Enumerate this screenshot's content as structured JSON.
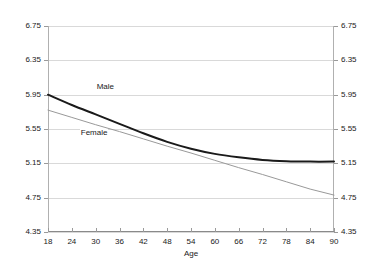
{
  "chart_data": {
    "type": "line",
    "title": "",
    "xlabel": "Age",
    "ylabel": "Mean Health Satisfaction",
    "xlim": [
      18,
      90
    ],
    "ylim": [
      4.35,
      6.75
    ],
    "xticks": [
      18,
      24,
      30,
      36,
      42,
      48,
      54,
      60,
      66,
      72,
      78,
      84,
      90
    ],
    "yticks": [
      4.35,
      4.75,
      5.15,
      5.55,
      5.95,
      6.35,
      6.75
    ],
    "xtick_labels": [
      "18",
      "24",
      "30",
      "36",
      "42",
      "48",
      "54",
      "60",
      "66",
      "72",
      "78",
      "84",
      "90"
    ],
    "ytick_labels": [
      "4.35",
      "4.75",
      "5.15",
      "5.55",
      "5.95",
      "6.35",
      "6.75"
    ],
    "ytick_labels_right": [
      "4.35",
      "4.75",
      "5.15",
      "5.55",
      "5.95",
      "6.35",
      "6.75"
    ],
    "grid": true,
    "grid_axis": "y",
    "mirrored_y_axis": true,
    "legend_position": "inline-labels",
    "series": [
      {
        "name": "Male",
        "color": "#1a1a1a",
        "width": 2.0,
        "shape": "curve",
        "label_x": 30,
        "label_y": 6.04,
        "x": [
          18,
          24,
          30,
          36,
          42,
          48,
          54,
          60,
          66,
          72,
          78,
          84,
          90
        ],
        "values": [
          5.95,
          5.83,
          5.72,
          5.61,
          5.5,
          5.4,
          5.32,
          5.26,
          5.22,
          5.19,
          5.175,
          5.17,
          5.17
        ]
      },
      {
        "name": "Female",
        "color": "#999999",
        "width": 1.0,
        "shape": "line",
        "label_x": 26,
        "label_y": 5.5,
        "x": [
          18,
          24,
          30,
          36,
          42,
          48,
          54,
          60,
          66,
          72,
          78,
          84,
          90
        ],
        "values": [
          5.77,
          5.685,
          5.6,
          5.52,
          5.435,
          5.35,
          5.27,
          5.185,
          5.1,
          5.02,
          4.935,
          4.85,
          4.78
        ]
      }
    ]
  }
}
